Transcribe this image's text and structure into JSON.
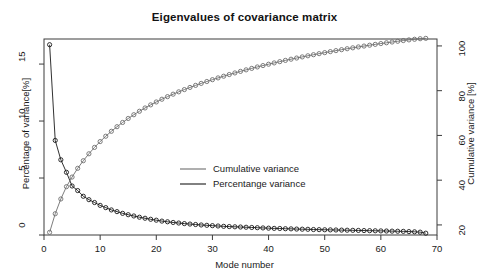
{
  "chart_data": {
    "type": "line",
    "title": "Eigenvalues of covariance matrix",
    "xlabel": "Mode number",
    "ylabel_left": "Percentage of variance[%]",
    "ylabel_right": "Cumulative variance [%]",
    "xlim": [
      0,
      70
    ],
    "xticks": [
      0,
      10,
      20,
      30,
      40,
      50,
      60,
      70
    ],
    "ylim_left": [
      0,
      17.2
    ],
    "yticks_left": [
      0,
      5,
      10,
      15
    ],
    "ylim_right": [
      15.5,
      103.1
    ],
    "yticks_right": [
      20,
      40,
      60,
      80,
      100
    ],
    "grid": false,
    "legend_position": "center",
    "markers": "open-circle",
    "x": [
      1,
      2,
      3,
      4,
      5,
      6,
      7,
      8,
      9,
      10,
      11,
      12,
      13,
      14,
      15,
      16,
      17,
      18,
      19,
      20,
      21,
      22,
      23,
      24,
      25,
      26,
      27,
      28,
      29,
      30,
      31,
      32,
      33,
      34,
      35,
      36,
      37,
      38,
      39,
      40,
      41,
      42,
      43,
      44,
      45,
      46,
      47,
      48,
      49,
      50,
      51,
      52,
      53,
      54,
      55,
      56,
      57,
      58,
      59,
      60,
      61,
      62,
      63,
      64,
      65,
      66,
      67,
      68
    ],
    "series": [
      {
        "name": "Percentange variance",
        "axis": "left",
        "color": "#1a1a1a",
        "values": [
          16.7,
          8.3,
          6.6,
          5.5,
          4.3,
          3.9,
          3.4,
          3.1,
          2.85,
          2.6,
          2.4,
          2.2,
          2.05,
          1.9,
          1.78,
          1.67,
          1.56,
          1.47,
          1.38,
          1.3,
          1.22,
          1.16,
          1.1,
          1.05,
          1.0,
          0.96,
          0.92,
          0.88,
          0.85,
          0.82,
          0.79,
          0.76,
          0.74,
          0.72,
          0.7,
          0.68,
          0.66,
          0.64,
          0.62,
          0.6,
          0.58,
          0.57,
          0.55,
          0.54,
          0.52,
          0.51,
          0.5,
          0.48,
          0.47,
          0.46,
          0.45,
          0.44,
          0.43,
          0.42,
          0.41,
          0.4,
          0.39,
          0.38,
          0.37,
          0.36,
          0.35,
          0.34,
          0.33,
          0.32,
          0.3,
          0.28,
          0.25,
          0.16
        ]
      },
      {
        "name": "Cumulative variance",
        "axis": "right",
        "color": "#6e6e6e",
        "values": [
          16.7,
          25.0,
          31.6,
          37.1,
          41.4,
          45.3,
          48.7,
          51.8,
          54.65,
          57.25,
          59.65,
          61.85,
          63.9,
          65.8,
          67.58,
          69.25,
          70.81,
          72.28,
          73.66,
          74.96,
          76.18,
          77.34,
          78.44,
          79.49,
          80.49,
          81.45,
          82.37,
          83.25,
          84.1,
          84.92,
          85.71,
          86.47,
          87.21,
          87.93,
          88.63,
          89.31,
          89.97,
          90.61,
          91.23,
          91.83,
          92.41,
          92.98,
          93.53,
          94.07,
          94.59,
          95.1,
          95.6,
          96.08,
          96.55,
          97.01,
          97.46,
          97.9,
          98.33,
          98.75,
          99.16,
          99.56,
          99.95,
          100.33,
          100.7,
          101.06,
          101.41,
          101.75,
          102.08,
          102.4,
          102.7,
          102.98,
          103.23,
          103.39
        ]
      }
    ],
    "legend": [
      {
        "label": "Cumulative variance",
        "color": "#6e6e6e"
      },
      {
        "label": "Percentange variance",
        "color": "#1a1a1a"
      }
    ]
  },
  "colors": {
    "axis": "#3c3c3c",
    "text": "#1a1a1a",
    "background": "#ffffff"
  }
}
